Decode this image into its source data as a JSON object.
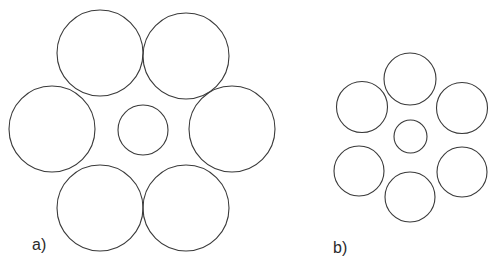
{
  "figure": {
    "background_color": "#ffffff",
    "stroke_color": "#3a3a3a",
    "label_color": "#2b2b2b",
    "width": 502,
    "height": 274
  },
  "chart_data": {
    "type": "scatter",
    "title": "",
    "xlabel": "",
    "ylabel": "",
    "xlim": [
      0,
      502
    ],
    "ylim": [
      274,
      0
    ],
    "grid": false,
    "legend": null,
    "panels": [
      {
        "id": "a",
        "label": "a)",
        "label_x": 32,
        "label_y": 250,
        "circle_count": 7,
        "outer_radius": 43,
        "center_radius": 25,
        "circles": [
          {
            "name": "outer-top-left",
            "cx": 100,
            "cy": 53,
            "r": 43
          },
          {
            "name": "outer-top-right",
            "cx": 186,
            "cy": 56,
            "r": 43
          },
          {
            "name": "outer-left",
            "cx": 52,
            "cy": 129,
            "r": 43
          },
          {
            "name": "outer-right",
            "cx": 232,
            "cy": 129,
            "r": 43
          },
          {
            "name": "outer-bottom-left",
            "cx": 100,
            "cy": 208,
            "r": 43
          },
          {
            "name": "outer-bottom-right",
            "cx": 186,
            "cy": 208,
            "r": 43
          },
          {
            "name": "center",
            "cx": 143,
            "cy": 130,
            "r": 25
          }
        ]
      },
      {
        "id": "b",
        "label": "b)",
        "label_x": 333,
        "label_y": 253,
        "circle_count": 7,
        "outer_radius": 25.5,
        "center_radius": 16.5,
        "circles": [
          {
            "name": "outer-top",
            "cx": 410,
            "cy": 79,
            "r": 26
          },
          {
            "name": "outer-upper-left",
            "cx": 362,
            "cy": 107,
            "r": 25.5
          },
          {
            "name": "outer-upper-right",
            "cx": 462,
            "cy": 108,
            "r": 25.5
          },
          {
            "name": "outer-lower-left",
            "cx": 359,
            "cy": 171,
            "r": 25
          },
          {
            "name": "outer-lower-right",
            "cx": 462,
            "cy": 172,
            "r": 25
          },
          {
            "name": "outer-bottom",
            "cx": 410,
            "cy": 197,
            "r": 25
          },
          {
            "name": "center",
            "cx": 410.5,
            "cy": 136.5,
            "r": 16.5
          }
        ]
      }
    ]
  }
}
